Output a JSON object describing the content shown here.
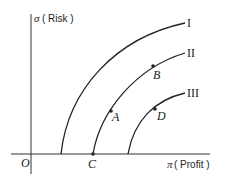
{
  "axes": {
    "y_label_symbol": "σ",
    "y_label_text": "( Risk )",
    "x_label_symbol": "π",
    "x_label_text": "( Profit )",
    "origin": "O"
  },
  "curves": [
    {
      "label": "I"
    },
    {
      "label": "II"
    },
    {
      "label": "III"
    }
  ],
  "points": [
    {
      "label": "A"
    },
    {
      "label": "B"
    },
    {
      "label": "C"
    },
    {
      "label": "D"
    }
  ],
  "colors": {
    "line": "#222222"
  }
}
